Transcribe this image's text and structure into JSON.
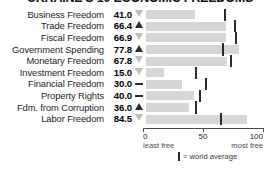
{
  "title": "UKRAINE'S 10 ECONOMIC FREEDOMS",
  "chart_data": {
    "type": "bar",
    "title": "UKRAINE'S 10 ECONOMIC FREEDOMS",
    "xlabel": "",
    "ylabel": "",
    "xlim": [
      0,
      100
    ],
    "grid": false,
    "legend_position": "bottom",
    "categories": [
      "Business Freedom",
      "Trade Freedom",
      "Fiscal Freedom",
      "Government Spending",
      "Monetary Freedom",
      "Investment Freedom",
      "Financial Freedom",
      "Property Rights",
      "Fdm. from Corruption",
      "Labor Freedom"
    ],
    "values": [
      41.0,
      66.4,
      66.9,
      77.8,
      67.8,
      15.0,
      30.0,
      40.0,
      36.0,
      84.5
    ],
    "value_labels": [
      "41.0",
      "66.4",
      "66.9",
      "77.8",
      "67.8",
      "15.0",
      "30.0",
      "40.0",
      "36.0",
      "84.5"
    ],
    "trends": [
      "down",
      "up",
      "down",
      "up",
      "down",
      "down",
      "flat",
      "flat",
      "up",
      "down"
    ],
    "world_average": [
      65,
      73,
      74,
      63,
      70,
      41,
      49,
      44,
      41,
      62
    ],
    "axis_ticks": [
      {
        "value": 0,
        "label": "0",
        "sublabel": "least free"
      },
      {
        "value": 50,
        "label": "50",
        "sublabel": ""
      },
      {
        "value": 100,
        "label": "100",
        "sublabel": "most free"
      }
    ],
    "legend": [
      {
        "marker": "vertical-bar",
        "text": "= world average"
      }
    ]
  },
  "colors": {
    "bar": "#d6d6d6",
    "average_marker": "#2b2b2b",
    "trend_up": "#2b2b2b",
    "trend_down": "#bdbdbd",
    "trend_flat": "#2b2b2b",
    "axis": "#4a4a4a",
    "text": "#1d1d1d",
    "background": "#ffffff"
  }
}
